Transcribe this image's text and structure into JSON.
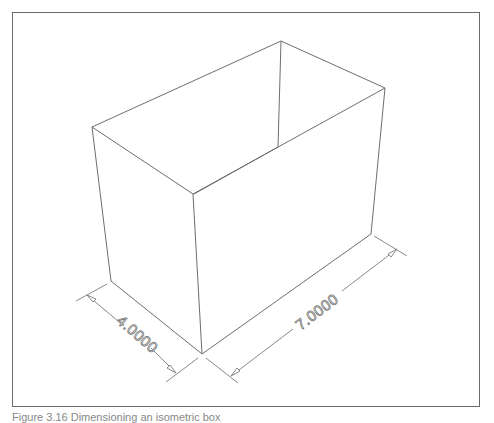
{
  "figure": {
    "caption": "Figure 3.16 Dimensioning an isometric box",
    "border_color": "#6a6a6a",
    "line_color": "#6e6e6e"
  },
  "box": {
    "vertices": {
      "top_left": [
        92,
        127
      ],
      "top_back": [
        281,
        41
      ],
      "top_right": [
        385,
        88
      ],
      "top_front": [
        193,
        194
      ],
      "bottom_left": [
        111,
        281
      ],
      "bottom_back": [
        278,
        147
      ],
      "bottom_right": [
        371,
        234
      ],
      "bottom_front": [
        202,
        354
      ]
    }
  },
  "dimensions": [
    {
      "id": "width",
      "label": "4.0000",
      "angle_deg": 41
    },
    {
      "id": "length",
      "label": "7.0000",
      "angle_deg": -37
    }
  ]
}
